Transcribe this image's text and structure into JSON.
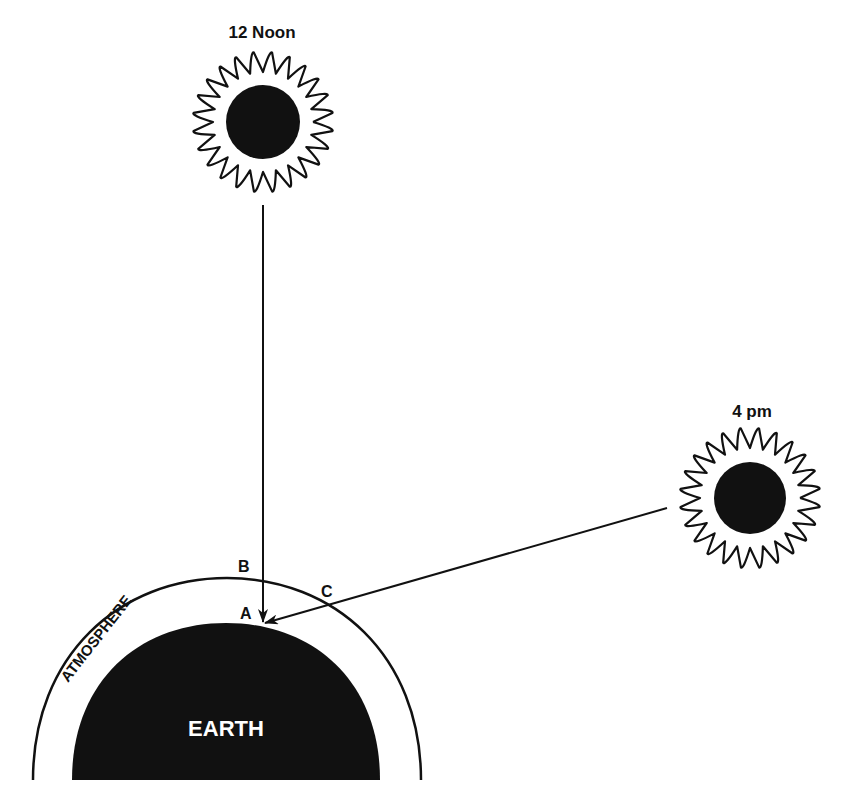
{
  "diagram": {
    "type": "sun-angle-atmosphere-path",
    "suns": [
      {
        "id": "noon",
        "label": "12 Noon",
        "cx": 263,
        "cy": 122
      },
      {
        "id": "afternoon",
        "label": "4 pm",
        "cx": 750,
        "cy": 498
      }
    ],
    "points": {
      "a": "A",
      "b": "B",
      "c": "C"
    },
    "regions": {
      "atmosphere": "ATMOSPHERE",
      "earth": "EARTH"
    },
    "colors": {
      "ink": "#111111",
      "background": "#ffffff",
      "earth_text": "#ffffff"
    }
  }
}
